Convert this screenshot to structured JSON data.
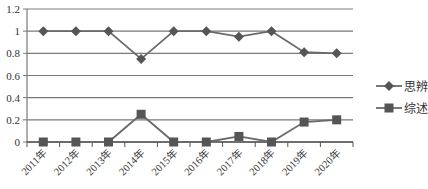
{
  "chart_data": {
    "type": "line",
    "title": "",
    "xlabel": "",
    "ylabel": "",
    "ylim": [
      0,
      1.2
    ],
    "yticks": [
      "0",
      "0.2",
      "0.4",
      "0.6",
      "0.8",
      "1",
      "1.2"
    ],
    "grid": true,
    "legend_position": "right",
    "categories": [
      "2011年",
      "2012年",
      "2013年",
      "2014年",
      "2015年",
      "2016年",
      "2017年",
      "2018年",
      "2019年",
      "2020年"
    ],
    "series": [
      {
        "name": "思辨",
        "marker": "diamond",
        "color": "#555555",
        "values": [
          1.0,
          1.0,
          1.0,
          0.75,
          1.0,
          1.0,
          0.95,
          1.0,
          0.81,
          0.8
        ]
      },
      {
        "name": "综述",
        "marker": "square",
        "color": "#555555",
        "values": [
          0.0,
          0.0,
          0.0,
          0.25,
          0.0,
          0.0,
          0.05,
          0.0,
          0.18,
          0.2
        ]
      }
    ]
  }
}
